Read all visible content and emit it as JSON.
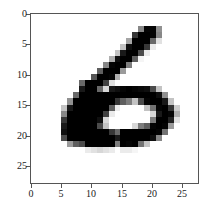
{
  "chart_data": {
    "type": "heatmap",
    "title": "",
    "xlabel": "",
    "ylabel": "",
    "colormap": "gray_r",
    "xlim": [
      -0.5,
      27.5
    ],
    "ylim": [
      27.5,
      -0.5
    ],
    "x_ticks": [
      0,
      5,
      10,
      15,
      20,
      25
    ],
    "y_ticks": [
      0,
      5,
      10,
      15,
      20,
      25
    ],
    "x_tick_labels": [
      "0",
      "5",
      "10",
      "15",
      "20",
      "25"
    ],
    "y_tick_labels": [
      "0",
      "5",
      "10",
      "15",
      "20",
      "25"
    ],
    "grid": false,
    "values": [
      [
        0,
        0,
        0,
        0,
        0,
        0,
        0,
        0,
        0,
        0,
        0,
        0,
        0,
        0,
        0,
        0,
        0,
        0,
        0,
        0,
        0,
        0,
        0,
        0,
        0,
        0,
        0,
        0
      ],
      [
        0,
        0,
        0,
        0,
        0,
        0,
        0,
        0,
        0,
        0,
        0,
        0,
        0,
        0,
        0,
        0,
        0,
        0,
        0,
        0,
        0,
        0,
        0,
        0,
        0,
        0,
        0,
        0
      ],
      [
        0,
        0,
        0,
        0,
        0,
        0,
        0,
        0,
        0,
        0,
        0,
        0,
        0,
        0,
        0,
        0,
        0,
        0,
        120,
        250,
        250,
        110,
        0,
        0,
        0,
        0,
        0,
        0
      ],
      [
        0,
        0,
        0,
        0,
        0,
        0,
        0,
        0,
        0,
        0,
        0,
        0,
        0,
        0,
        0,
        0,
        0,
        200,
        255,
        255,
        250,
        120,
        0,
        0,
        0,
        0,
        0,
        0
      ],
      [
        0,
        0,
        0,
        0,
        0,
        0,
        0,
        0,
        0,
        0,
        0,
        0,
        0,
        0,
        0,
        0,
        90,
        255,
        255,
        255,
        150,
        30,
        0,
        0,
        0,
        0,
        0,
        0
      ],
      [
        0,
        0,
        0,
        0,
        0,
        0,
        0,
        0,
        0,
        0,
        0,
        0,
        0,
        0,
        0,
        60,
        240,
        255,
        255,
        200,
        20,
        0,
        0,
        0,
        0,
        0,
        0,
        0
      ],
      [
        0,
        0,
        0,
        0,
        0,
        0,
        0,
        0,
        0,
        0,
        0,
        0,
        0,
        0,
        60,
        230,
        255,
        255,
        180,
        20,
        0,
        0,
        0,
        0,
        0,
        0,
        0,
        0
      ],
      [
        0,
        0,
        0,
        0,
        0,
        0,
        0,
        0,
        0,
        0,
        0,
        0,
        0,
        80,
        240,
        255,
        255,
        160,
        10,
        0,
        0,
        0,
        0,
        0,
        0,
        0,
        0,
        0
      ],
      [
        0,
        0,
        0,
        0,
        0,
        0,
        0,
        0,
        0,
        0,
        0,
        0,
        120,
        250,
        255,
        255,
        130,
        0,
        0,
        0,
        0,
        0,
        0,
        0,
        0,
        0,
        0,
        0
      ],
      [
        0,
        0,
        0,
        0,
        0,
        0,
        0,
        0,
        0,
        0,
        0,
        160,
        255,
        255,
        255,
        100,
        0,
        0,
        0,
        0,
        0,
        0,
        0,
        0,
        0,
        0,
        0,
        0
      ],
      [
        0,
        0,
        0,
        0,
        0,
        0,
        0,
        0,
        0,
        0,
        170,
        255,
        255,
        250,
        80,
        0,
        0,
        0,
        0,
        0,
        0,
        0,
        0,
        0,
        0,
        0,
        0,
        0
      ],
      [
        0,
        0,
        0,
        0,
        0,
        0,
        0,
        0,
        150,
        255,
        255,
        255,
        190,
        30,
        0,
        0,
        0,
        0,
        0,
        0,
        0,
        0,
        0,
        0,
        0,
        0,
        0,
        0
      ],
      [
        0,
        0,
        0,
        0,
        0,
        0,
        0,
        0,
        230,
        255,
        255,
        150,
        40,
        230,
        240,
        250,
        255,
        250,
        245,
        240,
        180,
        60,
        0,
        0,
        0,
        0,
        0,
        0
      ],
      [
        0,
        0,
        0,
        0,
        0,
        0,
        0,
        150,
        255,
        255,
        255,
        255,
        255,
        255,
        255,
        255,
        255,
        255,
        255,
        255,
        255,
        240,
        110,
        0,
        0,
        0,
        0,
        0
      ],
      [
        0,
        0,
        0,
        0,
        0,
        0,
        110,
        255,
        255,
        255,
        255,
        255,
        255,
        255,
        200,
        160,
        130,
        60,
        180,
        250,
        255,
        255,
        230,
        60,
        0,
        0,
        0,
        0
      ],
      [
        0,
        0,
        0,
        0,
        0,
        60,
        230,
        255,
        255,
        255,
        255,
        255,
        255,
        160,
        20,
        0,
        0,
        0,
        0,
        60,
        140,
        250,
        255,
        200,
        50,
        0,
        0,
        0
      ],
      [
        0,
        0,
        0,
        0,
        0,
        120,
        255,
        255,
        255,
        255,
        255,
        255,
        190,
        20,
        0,
        0,
        0,
        0,
        0,
        0,
        40,
        230,
        255,
        250,
        80,
        0,
        0,
        0
      ],
      [
        0,
        0,
        0,
        0,
        0,
        200,
        255,
        255,
        255,
        255,
        255,
        240,
        40,
        0,
        0,
        0,
        0,
        0,
        0,
        0,
        130,
        255,
        255,
        220,
        30,
        0,
        0,
        0
      ],
      [
        0,
        0,
        0,
        0,
        0,
        230,
        255,
        255,
        255,
        255,
        255,
        180,
        60,
        0,
        0,
        0,
        0,
        40,
        130,
        160,
        250,
        255,
        250,
        100,
        0,
        0,
        0,
        0
      ],
      [
        0,
        0,
        0,
        0,
        0,
        240,
        255,
        255,
        255,
        255,
        255,
        255,
        255,
        200,
        150,
        255,
        255,
        255,
        255,
        255,
        255,
        250,
        140,
        0,
        0,
        0,
        0,
        0
      ],
      [
        0,
        0,
        0,
        0,
        0,
        180,
        255,
        255,
        255,
        255,
        255,
        255,
        255,
        255,
        230,
        255,
        255,
        255,
        255,
        255,
        240,
        120,
        0,
        0,
        0,
        0,
        0,
        0
      ],
      [
        0,
        0,
        0,
        0,
        0,
        0,
        100,
        160,
        180,
        255,
        255,
        255,
        255,
        255,
        130,
        255,
        250,
        255,
        140,
        60,
        0,
        0,
        0,
        0,
        0,
        0,
        0,
        0
      ],
      [
        0,
        0,
        0,
        0,
        0,
        0,
        0,
        0,
        0,
        20,
        30,
        40,
        30,
        20,
        0,
        20,
        20,
        10,
        0,
        0,
        0,
        0,
        0,
        0,
        0,
        0,
        0,
        0
      ],
      [
        0,
        0,
        0,
        0,
        0,
        0,
        0,
        0,
        0,
        0,
        0,
        0,
        0,
        0,
        0,
        0,
        0,
        0,
        0,
        0,
        0,
        0,
        0,
        0,
        0,
        0,
        0,
        0
      ],
      [
        0,
        0,
        0,
        0,
        0,
        0,
        0,
        0,
        0,
        0,
        0,
        0,
        0,
        0,
        0,
        0,
        0,
        0,
        0,
        0,
        0,
        0,
        0,
        0,
        0,
        0,
        0,
        0
      ],
      [
        0,
        0,
        0,
        0,
        0,
        0,
        0,
        0,
        0,
        0,
        0,
        0,
        0,
        0,
        0,
        0,
        0,
        0,
        0,
        0,
        0,
        0,
        0,
        0,
        0,
        0,
        0,
        0
      ],
      [
        0,
        0,
        0,
        0,
        0,
        0,
        0,
        0,
        0,
        0,
        0,
        0,
        0,
        0,
        0,
        0,
        0,
        0,
        0,
        0,
        0,
        0,
        0,
        0,
        0,
        0,
        0,
        0
      ],
      [
        0,
        0,
        0,
        0,
        0,
        0,
        0,
        0,
        0,
        0,
        0,
        0,
        0,
        0,
        0,
        0,
        0,
        0,
        0,
        0,
        0,
        0,
        0,
        0,
        0,
        0,
        0,
        0
      ]
    ]
  },
  "axes": {
    "frame_color": "#555555",
    "tick_label_color": "#222222",
    "x_labels": [
      {
        "text": "0",
        "x": 31
      },
      {
        "text": "5",
        "x": 61
      },
      {
        "text": "10",
        "x": 91
      },
      {
        "text": "15",
        "x": 122
      },
      {
        "text": "20",
        "x": 152
      },
      {
        "text": "25",
        "x": 182
      }
    ],
    "y_labels": [
      {
        "text": "0",
        "y": 16
      },
      {
        "text": "5",
        "y": 46
      },
      {
        "text": "10",
        "y": 77
      },
      {
        "text": "15",
        "y": 107
      },
      {
        "text": "20",
        "y": 138
      },
      {
        "text": "25",
        "y": 168
      }
    ]
  }
}
